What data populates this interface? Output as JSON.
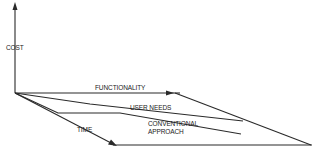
{
  "diagram": {
    "type": "cost-vs-functionality-vs-time",
    "axes": {
      "vertical": "COST",
      "horizontal": "FUNCTIONALITY",
      "depth": "TIME"
    },
    "curves": [
      {
        "id": "user-needs",
        "label": "USER NEEDS"
      },
      {
        "id": "conventional-approach",
        "label_line1": "CONVENTIONAL",
        "label_line2": "APPROACH"
      }
    ],
    "colors": {
      "line": "#2a2a2a",
      "background": "#ffffff"
    }
  }
}
